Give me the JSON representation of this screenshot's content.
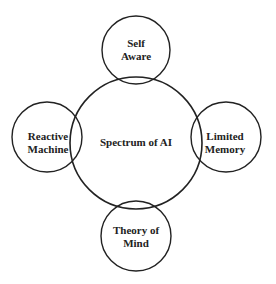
{
  "diagram": {
    "type": "hub-and-satellite",
    "colors": {
      "stroke": "#222222",
      "overlap_stroke": "#999999",
      "text": "#222222",
      "background": "#ffffff"
    },
    "center": {
      "label": "Spectrum of AI"
    },
    "satellites": [
      {
        "position": "top",
        "line1": "Self",
        "line2": "Aware"
      },
      {
        "position": "left",
        "line1": "Reactive",
        "line2": "Machine"
      },
      {
        "position": "right",
        "line1": "Limited",
        "line2": "Memory"
      },
      {
        "position": "bottom",
        "line1": "Theory of",
        "line2": "Mind"
      }
    ]
  }
}
